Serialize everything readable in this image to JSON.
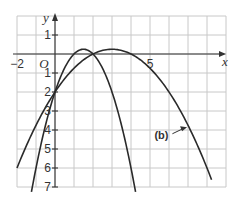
{
  "chart_data": {
    "type": "line",
    "title": "",
    "xlabel": "x",
    "ylabel": "y",
    "origin_label": "O",
    "xlim": [
      -2,
      9
    ],
    "ylim": [
      -7,
      2
    ],
    "grid": true,
    "x_tick_labels": [
      {
        "value": -2,
        "label": "−2"
      },
      {
        "value": 5,
        "label": "5"
      }
    ],
    "y_tick_labels": [
      {
        "value": 1,
        "label": "1"
      },
      {
        "value": -1,
        "label": "1"
      },
      {
        "value": -2,
        "label": "2"
      },
      {
        "value": -3,
        "label": "3"
      },
      {
        "value": -4,
        "label": "4"
      },
      {
        "value": -5,
        "label": "5"
      },
      {
        "value": -6,
        "label": "6"
      },
      {
        "value": -7,
        "label": "7"
      }
    ],
    "series": [
      {
        "name": "curve-a",
        "equation": "y = -x^2 + 3x - 2",
        "x_range": [
          -1.24,
          4.24
        ],
        "coefs": [
          -1,
          3,
          -2
        ]
      },
      {
        "name": "(b)",
        "equation": "y = -0.25x^2 + 1.5x - 2",
        "x_range": [
          -2,
          8.24
        ],
        "coefs": [
          -0.25,
          1.5,
          -2
        ]
      }
    ],
    "annotations": [
      {
        "text": "(b)",
        "at": [
          5.6,
          -4.25
        ],
        "arrow_to": [
          6.95,
          -3.85
        ]
      }
    ]
  }
}
